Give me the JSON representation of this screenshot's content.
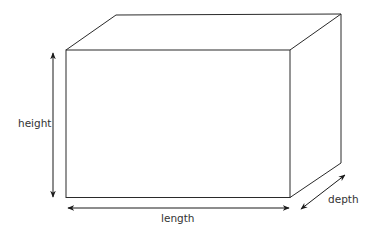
{
  "diagram": {
    "labels": {
      "height": "height",
      "length": "length",
      "depth": "depth"
    },
    "colors": {
      "line": "#2a2a2a",
      "text": "#333333",
      "background": "#ffffff"
    }
  }
}
